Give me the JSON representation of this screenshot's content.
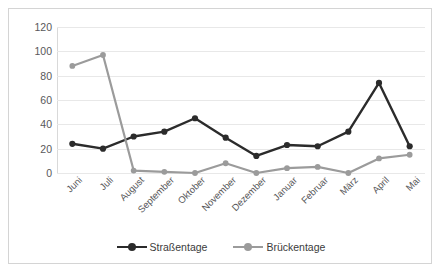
{
  "chart_data": {
    "type": "line",
    "title": "",
    "subtitle": "",
    "xlabel": "",
    "ylabel": "",
    "ylim": [
      0,
      120
    ],
    "yticks": [
      0,
      20,
      40,
      60,
      80,
      100,
      120
    ],
    "grid": true,
    "legend_position": "bottom",
    "categories": [
      "Juni",
      "Juli",
      "August",
      "September",
      "Oktober",
      "November",
      "Dezember",
      "Januar",
      "Februar",
      "März",
      "April",
      "Mai"
    ],
    "series": [
      {
        "name": "Straßentage",
        "color": "#2b2b2b",
        "marker": "circle",
        "values": [
          24,
          20,
          30,
          34,
          45,
          29,
          14,
          23,
          22,
          34,
          74,
          22
        ]
      },
      {
        "name": "Brückentage",
        "color": "#9b9b9b",
        "marker": "circle",
        "values": [
          88,
          97,
          2,
          1,
          0,
          8,
          0,
          4,
          5,
          0,
          12,
          15
        ]
      }
    ]
  },
  "colors": {
    "series_dark": "#2b2b2b",
    "series_gray": "#9b9b9b",
    "gridline": "#e8e8e8",
    "axis": "#d9d9d9",
    "border": "#d4d4d4",
    "tick_text": "#58585a",
    "legend_text": "#3b3b3b",
    "background": "#ffffff"
  }
}
